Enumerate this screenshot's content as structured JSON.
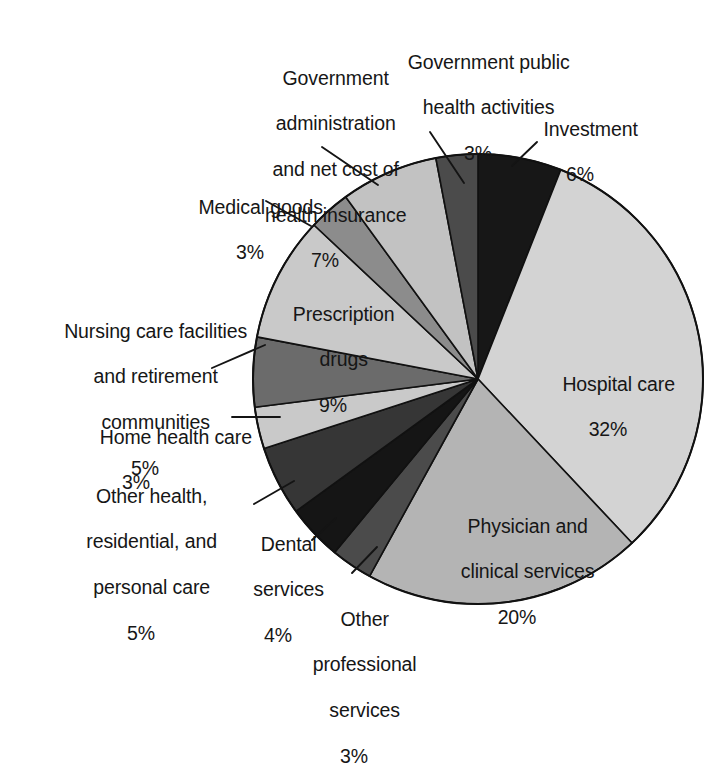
{
  "chart_data": {
    "type": "pie",
    "title": "",
    "subtitle": "",
    "xlabel": "",
    "ylabel": "",
    "legend_position": "none",
    "grid": false,
    "units": "percent",
    "total": 100,
    "start_angle_deg": 0,
    "direction": "clockwise",
    "categories": [
      "Investment",
      "Hospital care",
      "Physician and clinical services",
      "Other professional services",
      "Dental services",
      "Other health, residential, and personal care",
      "Home health care",
      "Nursing care facilities and retirement communities",
      "Prescription drugs",
      "Medical goods",
      "Government administration and net cost of health insurance",
      "Government public health activities"
    ],
    "values": [
      6,
      32,
      20,
      3,
      4,
      5,
      3,
      5,
      9,
      3,
      7,
      3
    ],
    "colors": [
      "#171717",
      "#d3d3d3",
      "#b4b4b4",
      "#4b4b4b",
      "#151515",
      "#363636",
      "#c9c9c9",
      "#6b6b6b",
      "#c9c9c9",
      "#8c8c8c",
      "#c2c2c2",
      "#4b4b4b"
    ],
    "slices": [
      {
        "name": "Investment",
        "label_lines": [
          "Investment"
        ],
        "percent_text": "6%",
        "value": 6,
        "color": "#171717",
        "label_placement": "outside",
        "has_leader_line": true
      },
      {
        "name": "Hospital care",
        "label_lines": [
          "Hospital care"
        ],
        "percent_text": "32%",
        "value": 32,
        "color": "#d3d3d3",
        "label_placement": "inside",
        "has_leader_line": false
      },
      {
        "name": "Physician and clinical services",
        "label_lines": [
          "Physician and",
          "clinical services"
        ],
        "percent_text": "20%",
        "value": 20,
        "color": "#b4b4b4",
        "label_placement": "inside",
        "has_leader_line": false
      },
      {
        "name": "Other professional services",
        "label_lines": [
          "Other",
          "professional",
          "services"
        ],
        "percent_text": "3%",
        "value": 3,
        "color": "#4b4b4b",
        "label_placement": "outside",
        "has_leader_line": true
      },
      {
        "name": "Dental services",
        "label_lines": [
          "Dental",
          "services"
        ],
        "percent_text": "4%",
        "value": 4,
        "color": "#151515",
        "label_placement": "outside",
        "has_leader_line": true
      },
      {
        "name": "Other health, residential, and personal care",
        "label_lines": [
          "Other health,",
          "residential, and",
          "personal care"
        ],
        "percent_text": "5%",
        "value": 5,
        "color": "#363636",
        "label_placement": "outside",
        "has_leader_line": true
      },
      {
        "name": "Home health care",
        "label_lines": [
          "Home health care"
        ],
        "percent_text": "3%",
        "value": 3,
        "color": "#c9c9c9",
        "label_placement": "outside",
        "has_leader_line": true
      },
      {
        "name": "Nursing care facilities and retirement communities",
        "label_lines": [
          "Nursing care facilities",
          "and retirement",
          "communities"
        ],
        "percent_text": "5%",
        "value": 5,
        "color": "#6b6b6b",
        "label_placement": "outside",
        "has_leader_line": true
      },
      {
        "name": "Prescription drugs",
        "label_lines": [
          "Prescription",
          "drugs"
        ],
        "percent_text": "9%",
        "value": 9,
        "color": "#c9c9c9",
        "label_placement": "inside",
        "has_leader_line": false
      },
      {
        "name": "Medical goods",
        "label_lines": [
          "Medical goods"
        ],
        "percent_text": "3%",
        "value": 3,
        "color": "#8c8c8c",
        "label_placement": "outside",
        "has_leader_line": true
      },
      {
        "name": "Government administration and net cost of health insurance",
        "label_lines": [
          "Government",
          "administration",
          "and net cost of",
          "health insurance"
        ],
        "percent_text": "7%",
        "value": 7,
        "color": "#c2c2c2",
        "label_placement": "outside",
        "has_leader_line": true
      },
      {
        "name": "Government public health activities",
        "label_lines": [
          "Government public",
          "health activities"
        ],
        "percent_text": "3%",
        "value": 3,
        "color": "#4b4b4b",
        "label_placement": "outside",
        "has_leader_line": true
      }
    ]
  },
  "labels": {
    "investment": {
      "l1": "Investment",
      "pct": "6%"
    },
    "gov_public_health": {
      "l1": "Government public",
      "l2": "health activities",
      "pct": "3%"
    },
    "gov_admin": {
      "l1": "Government",
      "l2": "administration",
      "l3": "and net cost of",
      "l4": "health insurance",
      "pct": "7%"
    },
    "medical_goods": {
      "l1": "Medical goods",
      "pct": "3%"
    },
    "nursing_care": {
      "l1": "Nursing care facilities",
      "l2": "and retirement",
      "l3": "communities",
      "pct": "5%"
    },
    "home_health": {
      "l1": "Home health care",
      "pct": "3%"
    },
    "other_health": {
      "l1": "Other health,",
      "l2": "residential, and",
      "l3": "personal care",
      "pct": "5%"
    },
    "dental": {
      "l1": "Dental",
      "l2": "services",
      "pct": "4%"
    },
    "other_prof": {
      "l1": "Other",
      "l2": "professional",
      "l3": "services",
      "pct": "3%"
    },
    "hospital": {
      "l1": "Hospital care",
      "pct": "32%"
    },
    "physician": {
      "l1": "Physician and",
      "l2": "clinical services",
      "pct": "20%"
    },
    "prescription": {
      "l1": "Prescription",
      "l2": "drugs",
      "pct": "9%"
    }
  },
  "geometry": {
    "center_x": 478,
    "center_y": 379,
    "radius": 225
  }
}
